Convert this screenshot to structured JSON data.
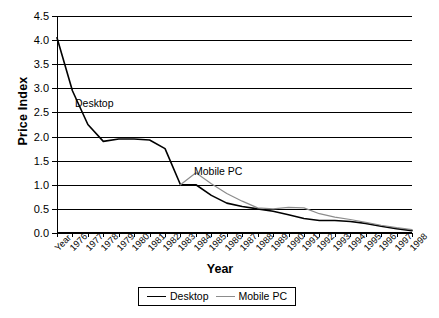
{
  "chart_data": {
    "type": "line",
    "title": "",
    "xlabel": "Year",
    "ylabel": "Price Index",
    "ylim": [
      0.0,
      4.5
    ],
    "ytick_step": 0.5,
    "ytick_labels": [
      "0.0",
      "0.5",
      "1.0",
      "1.5",
      "2.0",
      "2.5",
      "3.0",
      "3.5",
      "4.0",
      "4.5"
    ],
    "grid": "horizontal",
    "legend_position": "bottom-center",
    "categories": [
      "Year",
      "1976",
      "1977",
      "1978",
      "1979",
      "1980",
      "1981",
      "1982",
      "1983",
      "1984",
      "1985",
      "1986",
      "1987",
      "1988",
      "1989",
      "1990",
      "1991",
      "1992",
      "1993",
      "1994",
      "1995",
      "1996",
      "1997",
      "1998"
    ],
    "series": [
      {
        "name": "Desktop",
        "color": "#000000",
        "values": [
          4.05,
          2.95,
          2.25,
          1.9,
          1.95,
          1.95,
          1.93,
          1.75,
          1.0,
          1.0,
          0.78,
          0.62,
          0.55,
          0.5,
          0.45,
          0.38,
          0.3,
          0.26,
          0.26,
          0.24,
          0.2,
          0.14,
          0.09,
          0.05
        ]
      },
      {
        "name": "Mobile PC",
        "color": "#8c8c8c",
        "values": [
          null,
          null,
          null,
          null,
          null,
          null,
          null,
          null,
          1.0,
          1.25,
          1.02,
          0.82,
          0.66,
          0.52,
          0.5,
          0.53,
          0.52,
          0.4,
          0.33,
          0.28,
          0.22,
          0.16,
          0.11,
          0.07
        ]
      }
    ],
    "annotations": [
      {
        "text": "Desktop",
        "series": "Desktop"
      },
      {
        "text": "Mobile PC",
        "series": "Mobile PC"
      }
    ],
    "legend": [
      {
        "label": "Desktop",
        "color": "#000000"
      },
      {
        "label": "Mobile PC",
        "color": "#8c8c8c"
      }
    ]
  }
}
